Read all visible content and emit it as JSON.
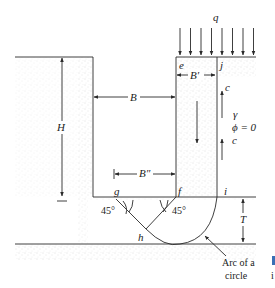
{
  "diagram": {
    "type": "braced-cut-bottom-heave",
    "labels": {
      "q": "q",
      "e": "e",
      "j": "j",
      "B_prime": "B′",
      "B": "B",
      "H": "H",
      "c_top": "c",
      "c_bottom": "c",
      "gamma": "γ",
      "phi": "ϕ = 0",
      "B_double_prime": "B″",
      "g": "g",
      "f": "f",
      "i": "i",
      "h": "h",
      "angle_left": "45°",
      "angle_right": "45°",
      "T": "T",
      "arc_line1": "Arc of a",
      "arc_line2": "circle",
      "edge_fragment": "i"
    },
    "colors": {
      "line": "#2a2a2a",
      "soil_stipple": "#d8d8d8",
      "accent_fragment": "#3a6fb5"
    },
    "load_arrow_count": 8
  }
}
